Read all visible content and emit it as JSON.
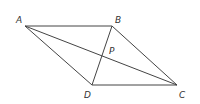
{
  "figure": {
    "background": "#ffffff",
    "stroke_color": "#444444",
    "vertices": [
      {
        "label": "A",
        "x": 25,
        "y": 26,
        "lx": 16,
        "ly": 23
      },
      {
        "label": "B",
        "x": 112,
        "y": 26,
        "lx": 115,
        "ly": 23
      },
      {
        "label": "C",
        "x": 177,
        "y": 85,
        "lx": 179,
        "ly": 98
      },
      {
        "label": "D",
        "x": 92,
        "y": 85,
        "lx": 84,
        "ly": 98
      }
    ],
    "intersection": {
      "label": "P",
      "lx": 109,
      "ly": 54
    }
  }
}
